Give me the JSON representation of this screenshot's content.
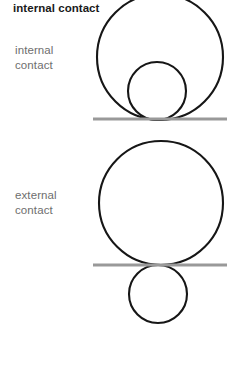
{
  "figure": {
    "title": "internal contact",
    "background_color": "#ffffff",
    "width": 235,
    "height": 366,
    "labels": {
      "internal": "internal\ncontact",
      "external": "external\ncontact"
    },
    "colors": {
      "circle_stroke": "#161616",
      "baseline": "#999999",
      "title_text": "#1a1a1a",
      "label_text": "#6e6e6e"
    },
    "panels": [
      {
        "name": "internal-contact-panel",
        "label": "internal\ncontact",
        "description": "Small circle inscribed inside a large circle, both tangent to the same baseline from above",
        "big_circle": {
          "cx": 160,
          "cy": 57,
          "r": 63
        },
        "small_circle": {
          "cx": 157,
          "cy": 91,
          "r": 29
        },
        "baseline": {
          "x1": 93,
          "x2": 227,
          "y": 119
        }
      },
      {
        "name": "external-contact-panel",
        "label": "external\ncontact",
        "description": "Large circle above the baseline and small circle below it, tangent to each other at the baseline",
        "big_circle": {
          "cx": 161,
          "cy": 203,
          "r": 62
        },
        "small_circle": {
          "cx": 158,
          "cy": 294,
          "r": 29
        },
        "baseline": {
          "x1": 93,
          "x2": 227,
          "y": 265
        }
      }
    ]
  }
}
